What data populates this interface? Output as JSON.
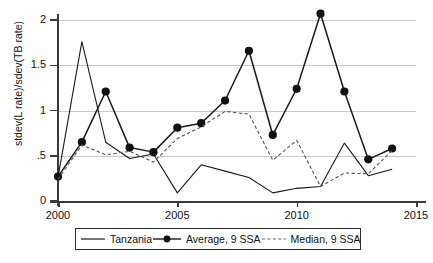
{
  "chart_data": {
    "type": "line",
    "title": "",
    "xlabel": "",
    "ylabel": "stdev(L rate)/sdev(TB rate)",
    "xlim": [
      2000,
      2015
    ],
    "ylim": [
      0,
      2.15
    ],
    "xticks": [
      "2000",
      "2005",
      "2010",
      "2015"
    ],
    "yticks": [
      "0",
      ".5",
      "1",
      "1.5",
      "2"
    ],
    "ytick_values": [
      0,
      0.5,
      1,
      1.5,
      2
    ],
    "grid": "horizontal",
    "legend_position": "below-plot",
    "x": [
      2000,
      2001,
      2002,
      2003,
      2004,
      2005,
      2006,
      2007,
      2008,
      2009,
      2010,
      2011,
      2012,
      2013,
      2014
    ],
    "series": [
      {
        "name": "Tanzania",
        "style": "solid",
        "marker": "none",
        "color": "#1a1a1a",
        "values": [
          0.26,
          1.76,
          0.65,
          0.47,
          0.52,
          0.09,
          0.4,
          0.33,
          0.26,
          0.09,
          0.14,
          0.16,
          0.64,
          0.28,
          0.35
        ]
      },
      {
        "name": "Average, 9 SSA",
        "style": "solid",
        "marker": "circle",
        "color": "#1a1a1a",
        "values": [
          0.27,
          0.65,
          1.21,
          0.59,
          0.54,
          0.81,
          0.86,
          1.11,
          1.66,
          0.73,
          1.24,
          2.07,
          1.21,
          0.46,
          0.58
        ]
      },
      {
        "name": "Median, 9 SSA",
        "style": "dashed",
        "marker": "none",
        "color": "#555555",
        "values": [
          0.24,
          0.62,
          0.51,
          0.55,
          0.43,
          0.69,
          0.82,
          0.99,
          0.96,
          0.45,
          0.67,
          0.16,
          0.31,
          0.3,
          0.56
        ]
      }
    ]
  },
  "legend": {
    "items": [
      {
        "label": "Tanzania",
        "key": "solid-line"
      },
      {
        "label": "Average, 9 SSA",
        "key": "line-with-circle-marker"
      },
      {
        "label": "Median, 9 SSA",
        "key": "dashed-line"
      }
    ]
  }
}
